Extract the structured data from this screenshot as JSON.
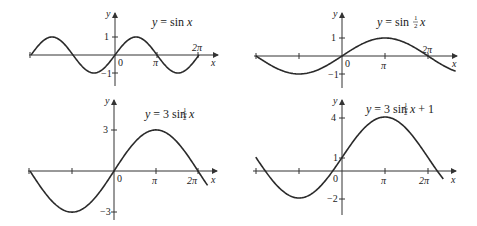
{
  "chart_data": [
    {
      "type": "line",
      "title": "y = sin x",
      "xlabel": "x",
      "ylabel": "y",
      "x_range": [
        -6.2832,
        6.2832
      ],
      "ylim": [
        -1,
        1
      ],
      "xticks": [
        "-2π",
        "-π",
        "0",
        "π",
        "2π"
      ],
      "yticks": [
        "1",
        "-1"
      ],
      "function": "sin(x)",
      "x": [
        -6.2832,
        -4.7124,
        -3.1416,
        -1.5708,
        0,
        1.5708,
        3.1416,
        4.7124,
        6.2832
      ],
      "values": [
        0,
        1,
        0,
        -1,
        0,
        1,
        0,
        -1,
        0
      ],
      "grid": false
    },
    {
      "type": "line",
      "title": "y = sin ½x",
      "xlabel": "x",
      "ylabel": "y",
      "x_range": [
        -6.2832,
        8.3
      ],
      "ylim": [
        -1,
        1
      ],
      "xticks": [
        "-2π",
        "-π",
        "0",
        "π",
        "2π"
      ],
      "yticks": [
        "1",
        "-1"
      ],
      "function": "sin(x/2)",
      "x": [
        -6.2832,
        -3.1416,
        0,
        3.1416,
        6.2832,
        8.3
      ],
      "values": [
        0,
        -1,
        0,
        1,
        0,
        -0.84
      ],
      "grid": false
    },
    {
      "type": "line",
      "title": "y = 3 sin ½x",
      "xlabel": "x",
      "ylabel": "y",
      "x_range": [
        -6.2832,
        7.0
      ],
      "ylim": [
        -3,
        3
      ],
      "xticks": [
        "-2π",
        "-π",
        "0",
        "π",
        "2π"
      ],
      "yticks": [
        "3",
        "-3"
      ],
      "function": "3*sin(x/2)",
      "x": [
        -6.2832,
        -3.1416,
        0,
        3.1416,
        6.2832,
        7.0
      ],
      "values": [
        0,
        -3,
        0,
        3,
        0,
        -1.05
      ],
      "grid": false
    },
    {
      "type": "line",
      "title": "y = 3 sin ½x + 1",
      "xlabel": "x",
      "ylabel": "y",
      "x_range": [
        -6.3,
        7.4
      ],
      "ylim": [
        -2,
        4
      ],
      "xticks": [
        "-2π",
        "-π",
        "0",
        "π",
        "2π"
      ],
      "yticks": [
        "4",
        "1",
        "-2"
      ],
      "function": "3*sin(x/2)+1",
      "x": [
        -6.2832,
        -3.1416,
        0,
        3.1416,
        6.2832,
        7.4
      ],
      "values": [
        1,
        -2,
        1,
        4,
        1,
        -0.6
      ],
      "grid": false
    }
  ],
  "panels": [
    {
      "title_main": "y = sin ",
      "title_var": "x",
      "frac": "",
      "suffix": "",
      "ylabel": "y",
      "xlabel": "x",
      "origin": "0",
      "pi": "π",
      "two_pi": "2π",
      "yticks": [
        "1",
        "−1"
      ]
    },
    {
      "title_main": "y = sin ",
      "title_var": "x",
      "frac": "½",
      "suffix": "",
      "ylabel": "y",
      "xlabel": "x",
      "origin": "0",
      "pi": "π",
      "two_pi": "2π",
      "yticks": [
        "1",
        "−1"
      ]
    },
    {
      "title_main": "y = 3 sin ",
      "title_var": "x",
      "frac": "½",
      "suffix": "",
      "ylabel": "y",
      "xlabel": "x",
      "origin": "0",
      "pi": "π",
      "two_pi": "2π",
      "yticks": [
        "3",
        "−3"
      ]
    },
    {
      "title_main": "y = 3 sin ",
      "title_var": "x",
      "frac": "½",
      "suffix": " + 1",
      "ylabel": "y",
      "xlabel": "x",
      "origin": "0",
      "pi": "π",
      "two_pi": "2π",
      "yticks": [
        "4",
        "1",
        "−2"
      ]
    }
  ]
}
